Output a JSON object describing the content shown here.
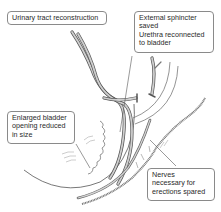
{
  "diagram": {
    "type": "medical-anatomy-illustration",
    "colors": {
      "line": "#555555",
      "tube_fill": "#c8c8c8",
      "callout_border": "#8a8a8a",
      "background": "#ffffff"
    },
    "callouts": [
      {
        "id": "urinary-tract",
        "lines": [
          "Urinary tract reconstruction"
        ]
      },
      {
        "id": "sphincter",
        "lines": [
          "External sphincter",
          "saved",
          "Urethra reconnected",
          "to bladder"
        ]
      },
      {
        "id": "bladder-opening",
        "lines": [
          "Enlarged bladder",
          "opening reduced",
          "in size"
        ]
      },
      {
        "id": "nerves",
        "lines": [
          "Nerves",
          "necessary for",
          "erections spared"
        ]
      }
    ]
  }
}
